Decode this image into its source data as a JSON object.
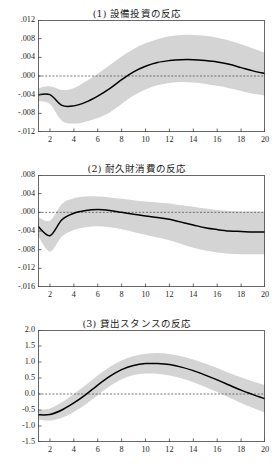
{
  "figure": {
    "top_cut_text_left": "",
    "top_cut_text_right": ""
  },
  "chart_data": [
    {
      "type": "line",
      "title": "(1) 設備投資の反応",
      "xlabel": "",
      "ylabel": "",
      "grid": false,
      "legend": "none",
      "zero_line": true,
      "xlim": [
        1,
        20
      ],
      "ylim": [
        -0.012,
        0.012
      ],
      "xticks": [
        2,
        4,
        6,
        8,
        10,
        12,
        14,
        16,
        18,
        20
      ],
      "xticklabels": [
        "2",
        "4",
        "6",
        "8",
        "10",
        "12",
        "14",
        "16",
        "18",
        "20"
      ],
      "yticks": [
        0.012,
        0.008,
        0.004,
        0.0,
        -0.004,
        -0.008,
        -0.012
      ],
      "yticklabels": [
        ".012",
        ".008",
        ".004",
        ".000",
        "-.004",
        "-.008",
        "-.012"
      ],
      "x": [
        1,
        2,
        3,
        4,
        5,
        6,
        7,
        8,
        9,
        10,
        11,
        12,
        13,
        14,
        15,
        16,
        17,
        18,
        19,
        20
      ],
      "series": [
        {
          "name": "response",
          "values": [
            -0.004,
            -0.004,
            -0.0063,
            -0.0064,
            -0.0056,
            -0.0043,
            -0.0027,
            -0.0008,
            0.0009,
            0.0021,
            0.0029,
            0.0033,
            0.0035,
            0.0035,
            0.0033,
            0.003,
            0.0025,
            0.0018,
            0.0011,
            0.0005
          ]
        },
        {
          "name": "upper-band",
          "values": [
            -0.0026,
            -0.0022,
            -0.003,
            -0.0026,
            -0.0012,
            0.0005,
            0.0023,
            0.0042,
            0.0058,
            0.007,
            0.0079,
            0.0085,
            0.0088,
            0.0088,
            0.0086,
            0.0082,
            0.0076,
            0.0068,
            0.0059,
            0.005
          ]
        },
        {
          "name": "lower-band",
          "values": [
            -0.0054,
            -0.006,
            -0.0096,
            -0.0102,
            -0.0098,
            -0.009,
            -0.0078,
            -0.006,
            -0.0042,
            -0.0029,
            -0.002,
            -0.0015,
            -0.0013,
            -0.0014,
            -0.0017,
            -0.0021,
            -0.0026,
            -0.0032,
            -0.0038,
            -0.0042
          ]
        }
      ]
    },
    {
      "type": "line",
      "title": "(2) 耐久財消費の反応",
      "xlabel": "",
      "ylabel": "",
      "grid": false,
      "legend": "none",
      "zero_line": true,
      "xlim": [
        1,
        20
      ],
      "ylim": [
        -0.016,
        0.008
      ],
      "xticks": [
        2,
        4,
        6,
        8,
        10,
        12,
        14,
        16,
        18,
        20
      ],
      "xticklabels": [
        "2",
        "4",
        "6",
        "8",
        "10",
        "12",
        "14",
        "16",
        "18",
        "20"
      ],
      "yticks": [
        0.008,
        0.004,
        0.0,
        -0.004,
        -0.008,
        -0.012,
        -0.016
      ],
      "yticklabels": [
        ".008",
        ".004",
        ".000",
        "-.004",
        "-.008",
        "-.012",
        "-.016"
      ],
      "x": [
        1,
        2,
        3,
        4,
        5,
        6,
        7,
        8,
        9,
        10,
        11,
        12,
        13,
        14,
        15,
        16,
        17,
        18,
        19,
        20
      ],
      "series": [
        {
          "name": "response",
          "values": [
            -0.003,
            -0.005,
            -0.0016,
            -0.0002,
            0.0004,
            0.0006,
            0.0004,
            0.0,
            -0.0004,
            -0.0008,
            -0.0011,
            -0.0015,
            -0.0021,
            -0.0027,
            -0.0033,
            -0.0037,
            -0.004,
            -0.0041,
            -0.0042,
            -0.0042
          ]
        },
        {
          "name": "upper-band",
          "values": [
            -0.001,
            -0.0018,
            0.0018,
            0.003,
            0.0034,
            0.0034,
            0.0032,
            0.0029,
            0.0026,
            0.0023,
            0.0021,
            0.0019,
            0.0015,
            0.0012,
            0.0008,
            0.0005,
            0.0003,
            0.0002,
            0.0002,
            0.0002
          ]
        },
        {
          "name": "lower-band",
          "values": [
            -0.005,
            -0.0084,
            -0.0052,
            -0.0038,
            -0.0032,
            -0.003,
            -0.0032,
            -0.0036,
            -0.0042,
            -0.0048,
            -0.0054,
            -0.006,
            -0.0068,
            -0.0076,
            -0.0082,
            -0.0086,
            -0.0089,
            -0.009,
            -0.009,
            -0.009
          ]
        }
      ]
    },
    {
      "type": "line",
      "title": "(3) 貸出スタンスの反応",
      "xlabel": "",
      "ylabel": "",
      "grid": false,
      "legend": "none",
      "zero_line": true,
      "xlim": [
        1,
        20
      ],
      "ylim": [
        -1.5,
        2.0
      ],
      "xticks": [
        2,
        4,
        6,
        8,
        10,
        12,
        14,
        16,
        18,
        20
      ],
      "xticklabels": [
        "2",
        "4",
        "6",
        "8",
        "10",
        "12",
        "14",
        "16",
        "18",
        "20"
      ],
      "yticks": [
        2.0,
        1.5,
        1.0,
        0.5,
        0.0,
        -0.5,
        -1.0,
        -1.5
      ],
      "yticklabels": [
        "2.0",
        "1.5",
        "1.0",
        "0.5",
        "0.0",
        "-0.5",
        "-1.0",
        "-1.5"
      ],
      "x": [
        1,
        2,
        3,
        4,
        5,
        6,
        7,
        8,
        9,
        10,
        11,
        12,
        13,
        14,
        15,
        16,
        17,
        18,
        19,
        20
      ],
      "series": [
        {
          "name": "response",
          "values": [
            -0.65,
            -0.64,
            -0.5,
            -0.28,
            -0.02,
            0.28,
            0.55,
            0.76,
            0.89,
            0.95,
            0.95,
            0.92,
            0.84,
            0.73,
            0.59,
            0.44,
            0.28,
            0.12,
            -0.02,
            -0.15
          ]
        },
        {
          "name": "upper-band",
          "values": [
            -0.5,
            -0.45,
            -0.26,
            0.0,
            0.28,
            0.58,
            0.84,
            1.05,
            1.19,
            1.26,
            1.28,
            1.25,
            1.18,
            1.08,
            0.95,
            0.81,
            0.66,
            0.52,
            0.39,
            0.28
          ]
        },
        {
          "name": "lower-band",
          "values": [
            -0.8,
            -0.83,
            -0.74,
            -0.56,
            -0.32,
            -0.04,
            0.24,
            0.46,
            0.59,
            0.64,
            0.63,
            0.58,
            0.49,
            0.37,
            0.22,
            0.06,
            -0.11,
            -0.28,
            -0.44,
            -0.58
          ]
        }
      ]
    }
  ]
}
